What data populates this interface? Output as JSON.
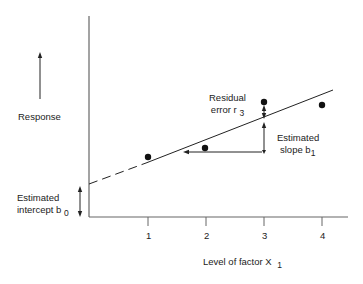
{
  "diagram": {
    "type": "linear-regression-illustration",
    "y_axis": {
      "label": "Response",
      "arrow": "up"
    },
    "x_axis": {
      "label": "Level of factor X",
      "label_subscript": "1",
      "ticks": [
        "1",
        "2",
        "3",
        "4"
      ]
    },
    "annotations": {
      "residual": {
        "line1": "Residual",
        "line2": "error r",
        "subscript": "3"
      },
      "slope": {
        "line1": "Estimated",
        "line2": "slope b",
        "subscript": "1"
      },
      "intercept": {
        "line1": "Estimated",
        "line2": "intercept b",
        "subscript": "0"
      }
    },
    "points": [
      {
        "x": 1,
        "px": 148,
        "py": 157
      },
      {
        "x": 2,
        "px": 205,
        "py": 148
      },
      {
        "x": 3,
        "px": 264,
        "py": 102
      },
      {
        "x": 4,
        "px": 322,
        "py": 105
      }
    ],
    "colors": {
      "ink": "#222222",
      "axis": "#555555",
      "background": "#ffffff"
    }
  }
}
